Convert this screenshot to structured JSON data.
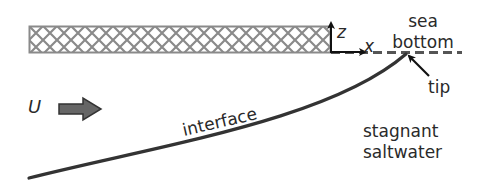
{
  "diagram": {
    "labels": {
      "axis_z": "z",
      "axis_x": "x",
      "sea_line1": "sea",
      "sea_line2": "bottom",
      "tip": "tip",
      "velocity": "U",
      "interface": "interface",
      "stagnant_line1": "stagnant",
      "stagnant_line2": "saltwater"
    },
    "colors": {
      "hatch": "#8a8a8a",
      "line": "#333333",
      "arrow_fill": "#666666",
      "text": "#2a2a2a"
    }
  }
}
